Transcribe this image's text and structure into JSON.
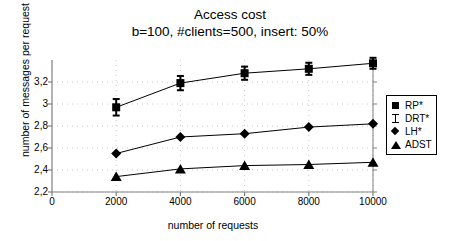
{
  "chart_data": {
    "type": "line",
    "title": "Access cost",
    "subtitle": "b=100, #clients=500, insert: 50%",
    "xlabel": "number of requests",
    "ylabel": "number of messages per request",
    "x": [
      2000,
      4000,
      6000,
      8000,
      10000
    ],
    "xlim": [
      0,
      10000
    ],
    "ylim": [
      2.2,
      3.4
    ],
    "xticks": [
      0,
      2000,
      4000,
      6000,
      8000,
      10000
    ],
    "xticklabels": [
      "0",
      "2000",
      "4000",
      "6000",
      "8000",
      "10000"
    ],
    "yticks": [
      2.2,
      2.4,
      2.6,
      2.8,
      3.0,
      3.2
    ],
    "yticklabels": [
      "2,2",
      "2,4",
      "2,6",
      "2,8",
      "3",
      "3,2"
    ],
    "grid": "dotted-major",
    "legend_position": "right",
    "series": [
      {
        "name": "RP*",
        "marker": "square",
        "values": [
          2.97,
          3.19,
          3.28,
          3.32,
          3.37
        ],
        "errors": [
          0.075,
          0.065,
          0.06,
          0.055,
          0.05
        ]
      },
      {
        "name": "DRT*",
        "marker": "ibeam",
        "values": [
          2.97,
          3.19,
          3.28,
          3.32,
          3.37
        ],
        "errors": [
          0.075,
          0.065,
          0.06,
          0.055,
          0.05
        ]
      },
      {
        "name": "LH*",
        "marker": "diamond",
        "values": [
          2.55,
          2.7,
          2.73,
          2.79,
          2.82
        ],
        "errors": [
          0,
          0,
          0,
          0,
          0
        ]
      },
      {
        "name": "ADST",
        "marker": "triangle",
        "values": [
          2.34,
          2.41,
          2.44,
          2.45,
          2.47
        ],
        "errors": [
          0,
          0,
          0,
          0,
          0
        ]
      }
    ]
  },
  "legend": {
    "items": [
      {
        "label": "RP*",
        "marker": "square"
      },
      {
        "label": "DRT*",
        "marker": "ibeam"
      },
      {
        "label": "LH*",
        "marker": "diamond"
      },
      {
        "label": "ADST",
        "marker": "triangle"
      }
    ]
  },
  "colors": {
    "series": "#000000",
    "axis": "#808080",
    "grid": "#c8c8c8",
    "background": "#ffffff"
  }
}
